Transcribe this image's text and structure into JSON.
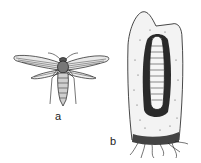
{
  "figure": {
    "panels": [
      {
        "id": "a",
        "label": "a",
        "subject": "adult clearwing moth, dorsal view, wings spread"
      },
      {
        "id": "b",
        "label": "b",
        "subject": "larva inside a tunnel in a root / stem section with rootlets"
      }
    ],
    "colors": {
      "ink": "#1a1a1a",
      "paper": "#ffffff"
    }
  }
}
